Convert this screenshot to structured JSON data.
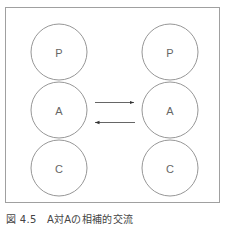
{
  "diagram": {
    "left_column": {
      "circles": [
        {
          "label": "P"
        },
        {
          "label": "A"
        },
        {
          "label": "C"
        }
      ]
    },
    "right_column": {
      "circles": [
        {
          "label": "P"
        },
        {
          "label": "A"
        },
        {
          "label": "C"
        }
      ]
    },
    "arrows": [
      {
        "from": "left.A",
        "to": "right.A",
        "direction": "right"
      },
      {
        "from": "right.A",
        "to": "left.A",
        "direction": "left"
      }
    ],
    "colors": {
      "stroke": "#8a8a8a",
      "border": "#a0a0a0",
      "text": "#666666"
    }
  },
  "caption": "図 4.5　A対Aの相補的交流"
}
